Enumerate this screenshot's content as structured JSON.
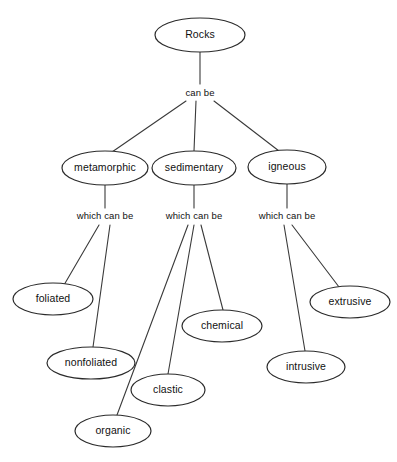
{
  "diagram": {
    "title": "Rocks",
    "type": "concept-map",
    "canvas": {
      "width": 397,
      "height": 462,
      "background": "#ffffff"
    },
    "style": {
      "node_stroke": "#2b2b2b",
      "node_fill": "#ffffff",
      "edge_stroke": "#3a3a3a",
      "text_color": "#111111"
    },
    "nodes": [
      {
        "id": "rocks",
        "label": "Rocks",
        "cx": 200,
        "cy": 35,
        "rx": 45,
        "ry": 17
      },
      {
        "id": "metamorphic",
        "label": "metamorphic",
        "cx": 105,
        "cy": 168,
        "rx": 43,
        "ry": 17
      },
      {
        "id": "sedimentary",
        "label": "sedimentary",
        "cx": 194,
        "cy": 168,
        "rx": 42,
        "ry": 17
      },
      {
        "id": "igneous",
        "label": "igneous",
        "cx": 287,
        "cy": 167,
        "rx": 39,
        "ry": 17
      },
      {
        "id": "foliated",
        "label": "foliated",
        "cx": 53,
        "cy": 299,
        "rx": 40,
        "ry": 16
      },
      {
        "id": "nonfoliated",
        "label": "nonfoliated",
        "cx": 91,
        "cy": 363,
        "rx": 44,
        "ry": 16
      },
      {
        "id": "organic",
        "label": "organic",
        "cx": 113,
        "cy": 431,
        "rx": 38,
        "ry": 16
      },
      {
        "id": "clastic",
        "label": "clastic",
        "cx": 168,
        "cy": 390,
        "rx": 37,
        "ry": 16
      },
      {
        "id": "chemical",
        "label": "chemical",
        "cx": 222,
        "cy": 326,
        "rx": 40,
        "ry": 16
      },
      {
        "id": "intrusive",
        "label": "intrusive",
        "cx": 306,
        "cy": 367,
        "rx": 39,
        "ry": 16
      },
      {
        "id": "extrusive",
        "label": "extrusive",
        "cx": 350,
        "cy": 302,
        "rx": 40,
        "ry": 16
      }
    ],
    "edge_labels": [
      {
        "id": "can-be",
        "label": "can be",
        "x": 200,
        "y": 93
      },
      {
        "id": "which-can-be-meta",
        "label": "which can be",
        "x": 105,
        "y": 216
      },
      {
        "id": "which-can-be-sed",
        "label": "which can be",
        "x": 194,
        "y": 216
      },
      {
        "id": "which-can-be-ign",
        "label": "which can be",
        "x": 287,
        "y": 216
      }
    ],
    "edges": [
      {
        "id": "rocks-to-canbe",
        "from": "rocks",
        "to": "can be label",
        "x1": 200,
        "y1": 52,
        "x2": 200,
        "y2": 84
      },
      {
        "id": "canbe-to-metamorphic",
        "from": "can be",
        "to": "metamorphic",
        "x1": 186,
        "y1": 101,
        "x2": 112,
        "y2": 152
      },
      {
        "id": "canbe-to-sedimentary",
        "from": "can be",
        "to": "sedimentary",
        "x1": 196,
        "y1": 101,
        "x2": 194,
        "y2": 151
      },
      {
        "id": "canbe-to-igneous",
        "from": "can be",
        "to": "igneous",
        "x1": 214,
        "y1": 101,
        "x2": 279,
        "y2": 151
      },
      {
        "id": "metamorphic-to-label",
        "from": "metamorphic",
        "to": "which can be",
        "x1": 105,
        "y1": 185,
        "x2": 105,
        "y2": 208
      },
      {
        "id": "sedimentary-to-label",
        "from": "sedimentary",
        "to": "which can be",
        "x1": 194,
        "y1": 185,
        "x2": 194,
        "y2": 208
      },
      {
        "id": "igneous-to-label",
        "from": "igneous",
        "to": "which can be",
        "x1": 287,
        "y1": 184,
        "x2": 287,
        "y2": 208
      },
      {
        "id": "meta-to-foliated",
        "from": "which can be",
        "to": "foliated",
        "x1": 99,
        "y1": 225,
        "x2": 64,
        "y2": 285
      },
      {
        "id": "meta-to-nonfoliated",
        "from": "which can be",
        "to": "nonfoliated",
        "x1": 110,
        "y1": 225,
        "x2": 93,
        "y2": 347
      },
      {
        "id": "sed-to-organic",
        "from": "which can be",
        "to": "organic",
        "x1": 188,
        "y1": 225,
        "x2": 117,
        "y2": 415
      },
      {
        "id": "sed-to-clastic",
        "from": "which can be",
        "to": "clastic",
        "x1": 194,
        "y1": 225,
        "x2": 168,
        "y2": 374
      },
      {
        "id": "sed-to-chemical",
        "from": "which can be",
        "to": "chemical",
        "x1": 201,
        "y1": 225,
        "x2": 223,
        "y2": 310
      },
      {
        "id": "ign-to-intrusive",
        "from": "which can be",
        "to": "intrusive",
        "x1": 284,
        "y1": 225,
        "x2": 305,
        "y2": 351
      },
      {
        "id": "ign-to-extrusive",
        "from": "which can be",
        "to": "extrusive",
        "x1": 292,
        "y1": 225,
        "x2": 339,
        "y2": 287
      }
    ]
  }
}
